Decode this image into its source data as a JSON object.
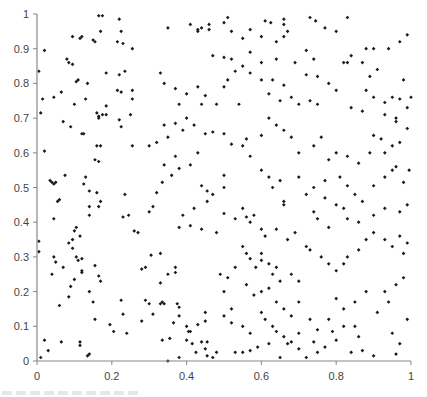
{
  "chart_data": {
    "type": "scatter",
    "title": "",
    "xlabel": "",
    "ylabel": "",
    "xlim": [
      0,
      1
    ],
    "ylim": [
      0,
      1
    ],
    "grid": false,
    "legend": null,
    "x_ticks": [
      "0",
      "0.2",
      "0.4",
      "0.6",
      "0.8",
      "1"
    ],
    "y_ticks": [
      "0",
      "0.1",
      "0.2",
      "0.3",
      "0.4",
      "0.5",
      "0.6",
      "0.7",
      "0.8",
      "0.9",
      "1"
    ],
    "marker_color": "#1a1a1a",
    "axis_color": "#888888",
    "points": [
      [
        0.005,
        0.835
      ],
      [
        0.01,
        0.715
      ],
      [
        0.015,
        0.755
      ],
      [
        0.02,
        0.895
      ],
      [
        0.045,
        0.76
      ],
      [
        0.065,
        0.775
      ],
      [
        0.07,
        0.69
      ],
      [
        0.09,
        0.675
      ],
      [
        0.095,
        0.935
      ],
      [
        0.115,
        0.93
      ],
      [
        0.12,
        0.935
      ],
      [
        0.165,
        0.995
      ],
      [
        0.175,
        0.995
      ],
      [
        0.17,
        0.95
      ],
      [
        0.15,
        0.925
      ],
      [
        0.155,
        0.92
      ],
      [
        0.22,
        0.985
      ],
      [
        0.225,
        0.95
      ],
      [
        0.215,
        0.92
      ],
      [
        0.23,
        0.915
      ],
      [
        0.255,
        0.9
      ],
      [
        0.185,
        0.83
      ],
      [
        0.22,
        0.825
      ],
      [
        0.235,
        0.835
      ],
      [
        0.08,
        0.87
      ],
      [
        0.085,
        0.86
      ],
      [
        0.095,
        0.855
      ],
      [
        0.105,
        0.805
      ],
      [
        0.11,
        0.81
      ],
      [
        0.135,
        0.8
      ],
      [
        0.13,
        0.755
      ],
      [
        0.1,
        0.74
      ],
      [
        0.16,
        0.715
      ],
      [
        0.165,
        0.705
      ],
      [
        0.175,
        0.71
      ],
      [
        0.185,
        0.735
      ],
      [
        0.165,
        0.7
      ],
      [
        0.185,
        0.71
      ],
      [
        0.22,
        0.695
      ],
      [
        0.225,
        0.675
      ],
      [
        0.215,
        0.78
      ],
      [
        0.225,
        0.775
      ],
      [
        0.255,
        0.78
      ],
      [
        0.255,
        0.755
      ],
      [
        0.25,
        0.71
      ],
      [
        0.12,
        0.655
      ],
      [
        0.125,
        0.655
      ],
      [
        0.16,
        0.62
      ],
      [
        0.17,
        0.62
      ],
      [
        0.255,
        0.62
      ],
      [
        0.04,
        0.515
      ],
      [
        0.035,
        0.52
      ],
      [
        0.045,
        0.51
      ],
      [
        0.05,
        0.515
      ],
      [
        0.075,
        0.535
      ],
      [
        0.02,
        0.605
      ],
      [
        0.055,
        0.46
      ],
      [
        0.06,
        0.465
      ],
      [
        0.045,
        0.41
      ],
      [
        0.005,
        0.345
      ],
      [
        0.005,
        0.315
      ],
      [
        0.13,
        0.53
      ],
      [
        0.125,
        0.51
      ],
      [
        0.14,
        0.49
      ],
      [
        0.16,
        0.485
      ],
      [
        0.14,
        0.445
      ],
      [
        0.165,
        0.445
      ],
      [
        0.17,
        0.46
      ],
      [
        0.155,
        0.58
      ],
      [
        0.165,
        0.575
      ],
      [
        0.235,
        0.48
      ],
      [
        0.245,
        0.42
      ],
      [
        0.23,
        0.415
      ],
      [
        0.14,
        0.42
      ],
      [
        0.045,
        0.3
      ],
      [
        0.05,
        0.285
      ],
      [
        0.07,
        0.27
      ],
      [
        0.04,
        0.25
      ],
      [
        0.095,
        0.35
      ],
      [
        0.1,
        0.375
      ],
      [
        0.105,
        0.385
      ],
      [
        0.115,
        0.36
      ],
      [
        0.085,
        0.34
      ],
      [
        0.095,
        0.325
      ],
      [
        0.105,
        0.3
      ],
      [
        0.11,
        0.29
      ],
      [
        0.12,
        0.295
      ],
      [
        0.12,
        0.255
      ],
      [
        0.12,
        0.26
      ],
      [
        0.1,
        0.235
      ],
      [
        0.09,
        0.215
      ],
      [
        0.085,
        0.185
      ],
      [
        0.155,
        0.275
      ],
      [
        0.165,
        0.245
      ],
      [
        0.17,
        0.23
      ],
      [
        0.14,
        0.2
      ],
      [
        0.01,
        0.01
      ],
      [
        0.02,
        0.06
      ],
      [
        0.03,
        0.03
      ],
      [
        0.065,
        0.055
      ],
      [
        0.115,
        0.045
      ],
      [
        0.115,
        0.055
      ],
      [
        0.135,
        0.015
      ],
      [
        0.14,
        0.02
      ],
      [
        0.06,
        0.16
      ],
      [
        0.155,
        0.12
      ],
      [
        0.195,
        0.105
      ],
      [
        0.205,
        0.085
      ],
      [
        0.24,
        0.08
      ],
      [
        0.15,
        0.17
      ],
      [
        0.225,
        0.175
      ],
      [
        0.23,
        0.135
      ],
      [
        0.29,
        0.175
      ],
      [
        0.3,
        0.165
      ],
      [
        0.31,
        0.135
      ],
      [
        0.33,
        0.165
      ],
      [
        0.335,
        0.17
      ],
      [
        0.335,
        0.06
      ],
      [
        0.355,
        0.065
      ],
      [
        0.35,
        0.0
      ],
      [
        0.38,
        0.01
      ],
      [
        0.365,
        0.11
      ],
      [
        0.375,
        0.165
      ],
      [
        0.38,
        0.155
      ],
      [
        0.4,
        0.06
      ],
      [
        0.405,
        0.085
      ],
      [
        0.415,
        0.05
      ],
      [
        0.425,
        0.025
      ],
      [
        0.45,
        0.14
      ],
      [
        0.455,
        0.055
      ],
      [
        0.455,
        0.015
      ],
      [
        0.28,
        0.115
      ],
      [
        0.28,
        0.265
      ],
      [
        0.29,
        0.27
      ],
      [
        0.26,
        0.375
      ],
      [
        0.27,
        0.37
      ],
      [
        0.305,
        0.305
      ],
      [
        0.33,
        0.31
      ],
      [
        0.35,
        0.25
      ],
      [
        0.37,
        0.27
      ],
      [
        0.37,
        0.255
      ],
      [
        0.33,
        0.225
      ],
      [
        0.34,
        0.165
      ],
      [
        0.38,
        0.13
      ],
      [
        0.4,
        0.1
      ],
      [
        0.41,
        0.085
      ],
      [
        0.43,
        0.105
      ],
      [
        0.44,
        0.055
      ],
      [
        0.45,
        0.035
      ],
      [
        0.47,
        0.01
      ],
      [
        0.48,
        0.025
      ],
      [
        0.45,
        0.115
      ],
      [
        0.3,
        0.43
      ],
      [
        0.31,
        0.445
      ],
      [
        0.32,
        0.485
      ],
      [
        0.335,
        0.515
      ],
      [
        0.36,
        0.535
      ],
      [
        0.34,
        0.565
      ],
      [
        0.38,
        0.555
      ],
      [
        0.37,
        0.59
      ],
      [
        0.41,
        0.565
      ],
      [
        0.43,
        0.6
      ],
      [
        0.44,
        0.505
      ],
      [
        0.455,
        0.49
      ],
      [
        0.47,
        0.48
      ],
      [
        0.5,
        0.535
      ],
      [
        0.5,
        0.5
      ],
      [
        0.455,
        0.46
      ],
      [
        0.42,
        0.44
      ],
      [
        0.39,
        0.42
      ],
      [
        0.38,
        0.385
      ],
      [
        0.41,
        0.39
      ],
      [
        0.44,
        0.38
      ],
      [
        0.48,
        0.37
      ],
      [
        0.5,
        0.425
      ],
      [
        0.53,
        0.41
      ],
      [
        0.3,
        0.62
      ],
      [
        0.32,
        0.63
      ],
      [
        0.35,
        0.645
      ],
      [
        0.34,
        0.68
      ],
      [
        0.37,
        0.685
      ],
      [
        0.39,
        0.665
      ],
      [
        0.4,
        0.7
      ],
      [
        0.42,
        0.68
      ],
      [
        0.45,
        0.655
      ],
      [
        0.47,
        0.66
      ],
      [
        0.5,
        0.655
      ],
      [
        0.52,
        0.625
      ],
      [
        0.55,
        0.62
      ],
      [
        0.57,
        0.59
      ],
      [
        0.56,
        0.64
      ],
      [
        0.6,
        0.65
      ],
      [
        0.33,
        0.83
      ],
      [
        0.34,
        0.8
      ],
      [
        0.37,
        0.785
      ],
      [
        0.38,
        0.74
      ],
      [
        0.4,
        0.77
      ],
      [
        0.43,
        0.79
      ],
      [
        0.44,
        0.74
      ],
      [
        0.45,
        0.765
      ],
      [
        0.48,
        0.74
      ],
      [
        0.5,
        0.79
      ],
      [
        0.51,
        0.81
      ],
      [
        0.53,
        0.835
      ],
      [
        0.54,
        0.74
      ],
      [
        0.57,
        0.83
      ],
      [
        0.6,
        0.81
      ],
      [
        0.63,
        0.81
      ],
      [
        0.35,
        0.96
      ],
      [
        0.41,
        0.97
      ],
      [
        0.43,
        0.955
      ],
      [
        0.43,
        0.95
      ],
      [
        0.44,
        0.96
      ],
      [
        0.46,
        0.955
      ],
      [
        0.46,
        0.97
      ],
      [
        0.5,
        0.975
      ],
      [
        0.51,
        0.99
      ],
      [
        0.52,
        0.95
      ],
      [
        0.55,
        0.93
      ],
      [
        0.57,
        0.955
      ],
      [
        0.47,
        0.88
      ],
      [
        0.5,
        0.875
      ],
      [
        0.52,
        0.87
      ],
      [
        0.55,
        0.85
      ],
      [
        0.61,
        0.98
      ],
      [
        0.625,
        0.975
      ],
      [
        0.66,
        0.985
      ],
      [
        0.66,
        0.97
      ],
      [
        0.67,
        0.95
      ],
      [
        0.6,
        0.935
      ],
      [
        0.64,
        0.92
      ],
      [
        0.66,
        0.935
      ],
      [
        0.57,
        0.89
      ],
      [
        0.6,
        0.86
      ],
      [
        0.64,
        0.87
      ],
      [
        0.69,
        0.86
      ],
      [
        0.72,
        0.895
      ],
      [
        0.74,
        0.87
      ],
      [
        0.82,
        0.86
      ],
      [
        0.84,
        0.88
      ],
      [
        0.62,
        0.77
      ],
      [
        0.65,
        0.75
      ],
      [
        0.68,
        0.76
      ],
      [
        0.7,
        0.74
      ],
      [
        0.73,
        0.75
      ],
      [
        0.75,
        0.74
      ],
      [
        0.72,
        0.825
      ],
      [
        0.66,
        0.795
      ],
      [
        0.75,
        0.82
      ],
      [
        0.78,
        0.8
      ],
      [
        0.83,
        0.86
      ],
      [
        0.87,
        0.86
      ],
      [
        0.89,
        0.82
      ],
      [
        0.8,
        0.78
      ],
      [
        0.88,
        0.78
      ],
      [
        0.91,
        0.84
      ],
      [
        0.84,
        0.73
      ],
      [
        0.87,
        0.72
      ],
      [
        0.9,
        0.76
      ],
      [
        0.93,
        0.745
      ],
      [
        0.95,
        0.76
      ],
      [
        0.97,
        0.755
      ],
      [
        1.0,
        0.76
      ],
      [
        0.96,
        0.7
      ],
      [
        0.96,
        0.69
      ],
      [
        0.99,
        0.73
      ],
      [
        0.93,
        0.71
      ],
      [
        0.73,
        0.99
      ],
      [
        0.745,
        0.98
      ],
      [
        0.77,
        0.96
      ],
      [
        0.8,
        0.95
      ],
      [
        0.83,
        0.99
      ],
      [
        0.88,
        0.9
      ],
      [
        0.9,
        0.9
      ],
      [
        0.94,
        0.9
      ],
      [
        0.97,
        0.92
      ],
      [
        0.99,
        0.94
      ],
      [
        0.98,
        0.81
      ],
      [
        0.95,
        0.62
      ],
      [
        0.93,
        0.6
      ],
      [
        0.62,
        0.7
      ],
      [
        0.64,
        0.68
      ],
      [
        0.66,
        0.665
      ],
      [
        0.68,
        0.645
      ],
      [
        0.7,
        0.6
      ],
      [
        0.74,
        0.62
      ],
      [
        0.76,
        0.645
      ],
      [
        0.78,
        0.58
      ],
      [
        0.8,
        0.6
      ],
      [
        0.83,
        0.59
      ],
      [
        0.86,
        0.57
      ],
      [
        0.89,
        0.6
      ],
      [
        0.9,
        0.65
      ],
      [
        0.92,
        0.64
      ],
      [
        0.97,
        0.63
      ],
      [
        0.99,
        0.67
      ],
      [
        0.6,
        0.55
      ],
      [
        0.62,
        0.53
      ],
      [
        0.63,
        0.5
      ],
      [
        0.65,
        0.52
      ],
      [
        0.66,
        0.46
      ],
      [
        0.66,
        0.45
      ],
      [
        0.7,
        0.53
      ],
      [
        0.72,
        0.48
      ],
      [
        0.74,
        0.43
      ],
      [
        0.75,
        0.41
      ],
      [
        0.78,
        0.385
      ],
      [
        0.82,
        0.44
      ],
      [
        0.83,
        0.505
      ],
      [
        0.85,
        0.48
      ],
      [
        0.87,
        0.46
      ],
      [
        0.9,
        0.505
      ],
      [
        0.93,
        0.53
      ],
      [
        0.95,
        0.55
      ],
      [
        0.96,
        0.56
      ],
      [
        0.98,
        0.515
      ],
      [
        0.995,
        0.55
      ],
      [
        0.99,
        0.45
      ],
      [
        0.97,
        0.43
      ],
      [
        0.93,
        0.44
      ],
      [
        0.9,
        0.42
      ],
      [
        0.86,
        0.4
      ],
      [
        0.83,
        0.41
      ],
      [
        0.8,
        0.45
      ],
      [
        0.77,
        0.47
      ],
      [
        0.74,
        0.5
      ],
      [
        0.77,
        0.52
      ],
      [
        0.81,
        0.53
      ],
      [
        0.55,
        0.44
      ],
      [
        0.56,
        0.415
      ],
      [
        0.57,
        0.4
      ],
      [
        0.58,
        0.42
      ],
      [
        0.6,
        0.38
      ],
      [
        0.61,
        0.36
      ],
      [
        0.64,
        0.38
      ],
      [
        0.67,
        0.35
      ],
      [
        0.69,
        0.37
      ],
      [
        0.72,
        0.33
      ],
      [
        0.73,
        0.32
      ],
      [
        0.76,
        0.3
      ],
      [
        0.78,
        0.28
      ],
      [
        0.8,
        0.26
      ],
      [
        0.82,
        0.28
      ],
      [
        0.83,
        0.3
      ],
      [
        0.86,
        0.32
      ],
      [
        0.88,
        0.35
      ],
      [
        0.9,
        0.37
      ],
      [
        0.93,
        0.35
      ],
      [
        0.95,
        0.33
      ],
      [
        0.98,
        0.31
      ],
      [
        0.97,
        0.36
      ],
      [
        0.99,
        0.34
      ],
      [
        0.55,
        0.33
      ],
      [
        0.56,
        0.31
      ],
      [
        0.57,
        0.295
      ],
      [
        0.585,
        0.27
      ],
      [
        0.6,
        0.29
      ],
      [
        0.6,
        0.31
      ],
      [
        0.62,
        0.28
      ],
      [
        0.63,
        0.25
      ],
      [
        0.64,
        0.27
      ],
      [
        0.65,
        0.23
      ],
      [
        0.68,
        0.25
      ],
      [
        0.7,
        0.23
      ],
      [
        0.53,
        0.27
      ],
      [
        0.51,
        0.24
      ],
      [
        0.49,
        0.25
      ],
      [
        0.5,
        0.2
      ],
      [
        0.52,
        0.15
      ],
      [
        0.5,
        0.13
      ],
      [
        0.52,
        0.11
      ],
      [
        0.55,
        0.1
      ],
      [
        0.57,
        0.08
      ],
      [
        0.6,
        0.14
      ],
      [
        0.61,
        0.12
      ],
      [
        0.63,
        0.1
      ],
      [
        0.64,
        0.085
      ],
      [
        0.66,
        0.07
      ],
      [
        0.68,
        0.055
      ],
      [
        0.7,
        0.035
      ],
      [
        0.72,
        0.01
      ],
      [
        0.74,
        0.055
      ],
      [
        0.75,
        0.025
      ],
      [
        0.77,
        0.04
      ],
      [
        0.79,
        0.085
      ],
      [
        0.8,
        0.06
      ],
      [
        0.82,
        0.1
      ],
      [
        0.84,
        0.025
      ],
      [
        0.85,
        0.1
      ],
      [
        0.86,
        0.07
      ],
      [
        0.87,
        0.03
      ],
      [
        0.9,
        0.015
      ],
      [
        0.91,
        0.14
      ],
      [
        0.94,
        0.17
      ],
      [
        0.95,
        0.08
      ],
      [
        0.97,
        0.05
      ],
      [
        0.99,
        0.12
      ],
      [
        0.96,
        0.02
      ],
      [
        0.93,
        0.2
      ],
      [
        0.96,
        0.22
      ],
      [
        0.98,
        0.24
      ],
      [
        0.88,
        0.2
      ],
      [
        0.85,
        0.17
      ],
      [
        0.82,
        0.15
      ],
      [
        0.8,
        0.18
      ],
      [
        0.78,
        0.12
      ],
      [
        0.75,
        0.09
      ],
      [
        0.73,
        0.12
      ],
      [
        0.7,
        0.17
      ],
      [
        0.68,
        0.13
      ],
      [
        0.66,
        0.15
      ],
      [
        0.64,
        0.17
      ],
      [
        0.56,
        0.22
      ],
      [
        0.58,
        0.19
      ],
      [
        0.6,
        0.2
      ],
      [
        0.62,
        0.21
      ],
      [
        0.57,
        0.03
      ],
      [
        0.55,
        0.025
      ],
      [
        0.53,
        0.025
      ],
      [
        0.59,
        0.04
      ],
      [
        0.62,
        0.05
      ],
      [
        0.65,
        0.01
      ],
      [
        0.67,
        0.05
      ],
      [
        0.7,
        0.08
      ]
    ]
  },
  "axes": {
    "x_ticks": [
      "0",
      "0.2",
      "0.4",
      "0.6",
      "0.8",
      "1"
    ],
    "y_ticks": [
      "0",
      "0.1",
      "0.2",
      "0.3",
      "0.4",
      "0.5",
      "0.6",
      "0.7",
      "0.8",
      "0.9",
      "1"
    ]
  }
}
